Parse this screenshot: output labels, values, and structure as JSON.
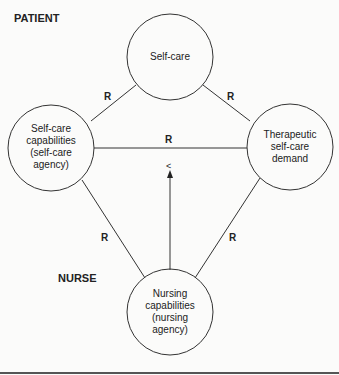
{
  "sections": {
    "patient": "PATIENT",
    "nurse": "NURSE"
  },
  "nodes": {
    "self_care": [
      "Self-care"
    ],
    "self_care_capabilities": [
      "Self-care",
      "capabilities",
      "(self-care",
      "agency)"
    ],
    "therapeutic_demand": [
      "Therapeutic",
      "self-care",
      "demand"
    ],
    "nursing_capabilities": [
      "Nursing",
      "capabilities",
      "(nursing",
      "agency)"
    ]
  },
  "relations": {
    "r_top_left": "R",
    "r_top_right": "R",
    "r_middle": "R",
    "r_bottom_left": "R",
    "r_bottom_right": "R",
    "deficit_symbol": "<"
  }
}
